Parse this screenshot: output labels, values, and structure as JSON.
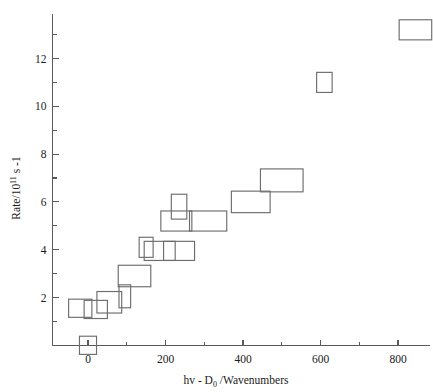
{
  "chart_data": {
    "type": "scatter",
    "title": "",
    "xlabel": "hv - D0 /Wavenumbers",
    "ylabel": "Rate/1011 s -1",
    "ylabel_parts": {
      "prefix": "Rate/10",
      "exponent": "11",
      "suffix": " s -1"
    },
    "xlabel_parts": {
      "prefix": "hv - D",
      "subscript": "0",
      "suffix": " /Wavenumbers"
    },
    "xlim": [
      -110,
      900
    ],
    "ylim": [
      -0.9,
      14.2
    ],
    "xticks": [
      0,
      200,
      400,
      600,
      800
    ],
    "xtick_labels": [
      "0",
      "200",
      "400",
      "600",
      "800"
    ],
    "xminorticks": [
      100,
      300,
      500,
      700
    ],
    "yticks": [
      2,
      4,
      6,
      8,
      10,
      12
    ],
    "ytick_labels": [
      "2",
      "4",
      "6",
      "8",
      "10",
      "12"
    ],
    "yminorticks": [
      1,
      3,
      5,
      7,
      9,
      11,
      13
    ],
    "grid": false,
    "legend": "none",
    "marker_style": "open-rectangle",
    "marker_note": "each datum drawn as an open rectangle whose width is the x-uncertainty and height the y-uncertainty",
    "points": [
      {
        "x": 0,
        "y": 0.0,
        "xerr": 22,
        "yerr": 0.38
      },
      {
        "x": -20,
        "y": 1.55,
        "xerr": 30,
        "yerr": 0.38
      },
      {
        "x": 20,
        "y": 1.5,
        "xerr": 30,
        "yerr": 0.38
      },
      {
        "x": 55,
        "y": 1.8,
        "xerr": 32,
        "yerr": 0.45
      },
      {
        "x": 95,
        "y": 2.05,
        "xerr": 15,
        "yerr": 0.48
      },
      {
        "x": 120,
        "y": 2.9,
        "xerr": 42,
        "yerr": 0.45
      },
      {
        "x": 150,
        "y": 4.1,
        "xerr": 18,
        "yerr": 0.42
      },
      {
        "x": 185,
        "y": 3.95,
        "xerr": 40,
        "yerr": 0.4
      },
      {
        "x": 235,
        "y": 3.95,
        "xerr": 40,
        "yerr": 0.4
      },
      {
        "x": 235,
        "y": 5.8,
        "xerr": 20,
        "yerr": 0.52
      },
      {
        "x": 228,
        "y": 5.2,
        "xerr": 40,
        "yerr": 0.42
      },
      {
        "x": 310,
        "y": 5.2,
        "xerr": 48,
        "yerr": 0.42
      },
      {
        "x": 420,
        "y": 6.0,
        "xerr": 50,
        "yerr": 0.45
      },
      {
        "x": 500,
        "y": 6.9,
        "xerr": 55,
        "yerr": 0.48
      },
      {
        "x": 610,
        "y": 11.0,
        "xerr": 20,
        "yerr": 0.42
      },
      {
        "x": 845,
        "y": 13.2,
        "xerr": 42,
        "yerr": 0.42
      }
    ]
  }
}
